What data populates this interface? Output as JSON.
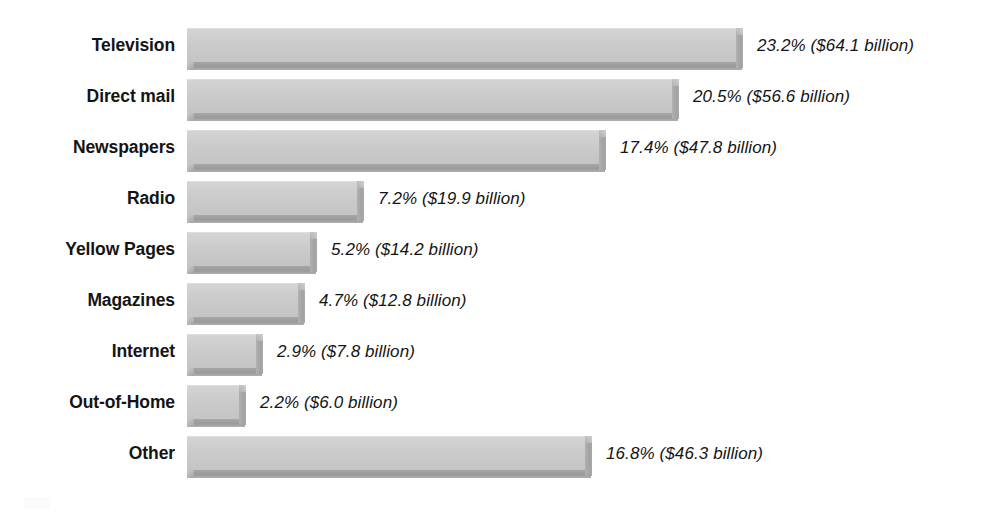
{
  "chart_data": {
    "type": "bar",
    "orientation": "horizontal",
    "title": "",
    "subtitle": "",
    "xlabel": "",
    "ylabel": "",
    "grid": false,
    "legend": false,
    "axis_visible": false,
    "value_unit": "percent",
    "currency_unit": "billion USD",
    "xlim": [
      0,
      23.2
    ],
    "categories": [
      "Television",
      "Direct mail",
      "Newspapers",
      "Radio",
      "Yellow Pages",
      "Magazines",
      "Internet",
      "Out-of-Home",
      "Other"
    ],
    "values": [
      23.2,
      20.5,
      17.4,
      7.2,
      5.2,
      4.7,
      2.9,
      2.2,
      16.8
    ],
    "dollars": [
      64.1,
      56.6,
      47.8,
      19.9,
      14.2,
      12.8,
      7.8,
      6.0,
      46.3
    ],
    "data_labels": [
      "23.2% ($64.1 billion)",
      "20.5% ($56.6 billion)",
      "17.4% ($47.8 billion)",
      "7.2% ($19.9 billion)",
      "5.2% ($14.2 billion)",
      "4.7% ($12.8 billion)",
      "2.9% ($7.8 billion)",
      "2.2% ($6.0 billion)",
      "16.8% ($46.3 billion)"
    ]
  },
  "style": {
    "bar_face_color": "#cbcbcb",
    "bar_shadow_color": "#9a9a9a",
    "bar_side_color": "#a2a2a2",
    "text_color": "#141414",
    "background_color": "#ffffff"
  },
  "rows": [
    {
      "label": "Television",
      "value": 23.2,
      "dollars": 64.1,
      "data_label": "23.2% ($64.1 billion)"
    },
    {
      "label": "Direct mail",
      "value": 20.5,
      "dollars": 56.6,
      "data_label": "20.5% ($56.6 billion)"
    },
    {
      "label": "Newspapers",
      "value": 17.4,
      "dollars": 47.8,
      "data_label": "17.4% ($47.8 billion)"
    },
    {
      "label": "Radio",
      "value": 7.2,
      "dollars": 19.9,
      "data_label": "7.2% ($19.9 billion)"
    },
    {
      "label": "Yellow Pages",
      "value": 5.2,
      "dollars": 14.2,
      "data_label": "5.2% ($14.2 billion)"
    },
    {
      "label": "Magazines",
      "value": 4.7,
      "dollars": 12.8,
      "data_label": "4.7% ($12.8 billion)"
    },
    {
      "label": "Internet",
      "value": 2.9,
      "dollars": 7.8,
      "data_label": "2.9% ($7.8 billion)"
    },
    {
      "label": "Out-of-Home",
      "value": 2.2,
      "dollars": 6.0,
      "data_label": "2.2% ($6.0 billion)"
    },
    {
      "label": "Other",
      "value": 16.8,
      "dollars": 46.3,
      "data_label": "16.8% ($46.3 billion)"
    }
  ]
}
